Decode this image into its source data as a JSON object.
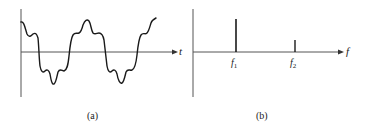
{
  "figure": {
    "panels": [
      {
        "id": "a",
        "caption": "(a)",
        "axis_label": "t",
        "description": "time-domain waveform: sum of fundamental and higher-frequency harmonic"
      },
      {
        "id": "b",
        "caption": "(b)",
        "axis_label": "f",
        "spikes": [
          {
            "label": "f",
            "subscript": "1",
            "relative_height": 1.0
          },
          {
            "label": "f",
            "subscript": "2",
            "relative_height": 0.36
          }
        ]
      }
    ],
    "colors": {
      "axis": "#555555",
      "curve": "#1a1a1a",
      "text": "#222222"
    }
  }
}
